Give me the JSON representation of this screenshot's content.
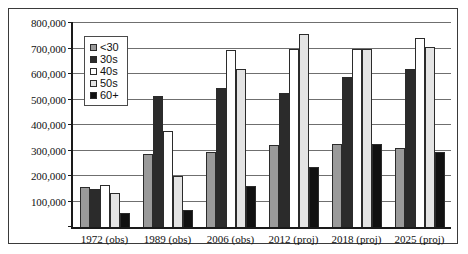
{
  "chart_data": {
    "type": "bar",
    "title": "",
    "subtitle": "",
    "xlabel": "",
    "ylabel": "",
    "ylim": [
      0,
      800000
    ],
    "ytick_values": [
      0,
      100000,
      200000,
      300000,
      400000,
      500000,
      600000,
      700000,
      800000
    ],
    "ytick_labels": [
      "",
      "100,000",
      "200,000",
      "300,000",
      "400,000",
      "500,000",
      "600,000",
      "700,000",
      "800,000"
    ],
    "grid": true,
    "legend_position": "upper-left-inside",
    "categories": [
      "1972 (obs)",
      "1989 (obs)",
      "2006 (obs)",
      "2012 (proj)",
      "2018 (proj)",
      "2025 (proj)"
    ],
    "series": [
      {
        "name": "<30",
        "color": "#9a9a9a",
        "values": [
          155000,
          285000,
          295000,
          320000,
          325000,
          310000
        ]
      },
      {
        "name": "30s",
        "color": "#2b2b2b",
        "values": [
          150000,
          515000,
          545000,
          525000,
          590000,
          620000
        ]
      },
      {
        "name": "40s",
        "color": "#ffffff",
        "values": [
          165000,
          375000,
          695000,
          700000,
          700000,
          740000
        ]
      },
      {
        "name": "50s",
        "color": "#e4e4e4",
        "values": [
          135000,
          200000,
          620000,
          755000,
          700000,
          705000
        ]
      },
      {
        "name": "60+",
        "color": "#111111",
        "values": [
          55000,
          65000,
          160000,
          235000,
          325000,
          295000
        ]
      }
    ]
  }
}
